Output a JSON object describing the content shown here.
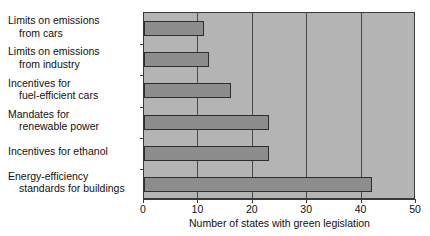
{
  "chart_data": {
    "type": "bar",
    "orientation": "horizontal",
    "title": "",
    "xlabel": "Number of states with green legislation",
    "ylabel": "",
    "xlim": [
      0,
      50
    ],
    "xticks": [
      0,
      10,
      20,
      30,
      40,
      50
    ],
    "gridlines": [
      10,
      20,
      30,
      40
    ],
    "grid": true,
    "legend": null,
    "categories": [
      "Limits on emissions from cars",
      "Limits on emissions from industry",
      "Incentives for fuel-efficient cars",
      "Mandates for renewable power",
      "Incentives for ethanol",
      "Energy-efficiency standards for buildings"
    ],
    "category_lines": [
      [
        "Limits on emissions",
        "from cars"
      ],
      [
        "Limits on emissions",
        "from industry"
      ],
      [
        "Incentives for",
        "fuel-efficient cars"
      ],
      [
        "Mandates for",
        "renewable power"
      ],
      [
        "Incentives for ethanol",
        ""
      ],
      [
        "Energy-efficiency",
        "standards for buildings"
      ]
    ],
    "values": [
      11,
      12,
      16,
      23,
      23,
      42
    ],
    "colors": {
      "bar_fill": "#8d8d8d",
      "bar_edge": "#2e2e2e",
      "plot_background": "#b4b4b4",
      "grid": "#4a4a4a",
      "axis": "#3a3a3a",
      "text": "#111111",
      "page_background": "#ffffff"
    }
  }
}
